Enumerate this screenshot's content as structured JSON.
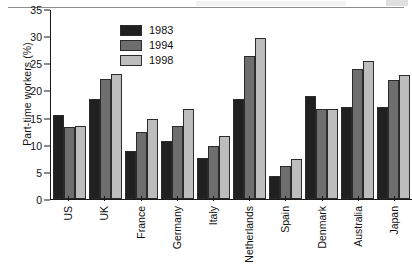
{
  "chart_data": {
    "type": "bar",
    "title": "",
    "xlabel": "",
    "ylabel": "Part-time workers (%)",
    "ylim": [
      0,
      35
    ],
    "ytick_step": 5,
    "yticks": [
      "0",
      "5",
      "10",
      "15",
      "20",
      "25",
      "30",
      "35"
    ],
    "grid": false,
    "legend_position": "top-center",
    "categories": [
      "US",
      "UK",
      "France",
      "Germany",
      "Italy",
      "Netherlands",
      "Spain",
      "Denmark",
      "Australia",
      "Japan"
    ],
    "series": [
      {
        "name": "1983",
        "color": "#202020",
        "values": [
          15.5,
          18.5,
          8.8,
          10.7,
          7.6,
          18.4,
          4.3,
          18.9,
          17.0,
          17.0
        ]
      },
      {
        "name": "1994",
        "color": "#6e6e6e",
        "values": [
          13.3,
          22.2,
          12.4,
          13.4,
          9.8,
          26.3,
          6.1,
          16.6,
          24.0,
          22.0
        ]
      },
      {
        "name": "1998",
        "color": "#bdbdbd",
        "values": [
          13.5,
          23.1,
          14.7,
          16.5,
          11.6,
          29.7,
          7.4,
          16.6,
          25.4,
          22.8
        ]
      }
    ]
  }
}
